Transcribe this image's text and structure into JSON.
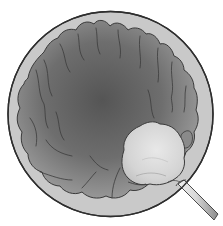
{
  "figure": {
    "description": "Endoscopic circular field of view showing folded gray mucosal tissue with a pale lesion at lower right and a probe instrument entering from the lower right edge",
    "colors": {
      "background": "#ffffff",
      "outer_ring": "#c8c8c8",
      "ring_outline": "#333333",
      "tissue_center": "#5a5a5a",
      "tissue_edge": "#9a9a9a",
      "fold_lines": "#3a3a3a",
      "lesion_fill": "#d6d6d6",
      "lesion_highlight": "#e6e6e6",
      "probe_light": "#e8e8e8",
      "probe_dark": "#8a8a8a"
    },
    "elements": [
      {
        "name": "field-of-view-ring",
        "label": "Circular scope view"
      },
      {
        "name": "mucosal-tissue",
        "label": "Folded mucosa"
      },
      {
        "name": "lesion",
        "label": "Pale lesion"
      },
      {
        "name": "probe",
        "label": "Probe instrument"
      }
    ]
  }
}
